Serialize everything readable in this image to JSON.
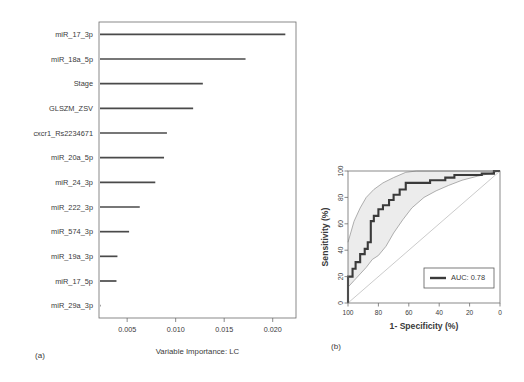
{
  "figure": {
    "panel_a_tag": "(a)",
    "panel_b_tag": "(b)"
  },
  "chart_data": [
    {
      "type": "bar",
      "orientation": "horizontal",
      "title": "",
      "xlabel": "Variable Importance: LC",
      "ylabel": "",
      "xlim": [
        0.0021,
        0.0224
      ],
      "xticks": [
        0.005,
        0.01,
        0.015,
        0.02
      ],
      "xtick_labels": [
        "0.005",
        "0.010",
        "0.015",
        "0.020"
      ],
      "grid": false,
      "legend": "none",
      "categories": [
        "miR_17_3p",
        "miR_18a_5p",
        "Stage",
        "GLSZM_ZSV",
        "cxcr1_Rs2234671",
        "miR_20a_5p",
        "miR_24_3p",
        "miR_222_3p",
        "miR_574_3p",
        "miR_19a_3p",
        "miR_17_5p",
        "miR_29a_3p"
      ],
      "values": [
        0.0213,
        0.0172,
        0.0128,
        0.0118,
        0.0091,
        0.0088,
        0.0079,
        0.0063,
        0.0052,
        0.004,
        0.0039,
        0.0022
      ]
    },
    {
      "type": "line",
      "subtype": "roc",
      "title": "",
      "xlabel": "1- Specificity (%)",
      "ylabel": "Sensitivity (%)",
      "xlim": [
        100,
        0
      ],
      "ylim": [
        0,
        100
      ],
      "x_reversed": true,
      "xticks": [
        100,
        80,
        60,
        40,
        20,
        0
      ],
      "xtick_labels": [
        "100",
        "80",
        "60",
        "40",
        "20",
        "0"
      ],
      "yticks": [
        0,
        20,
        40,
        60,
        80,
        100
      ],
      "ytick_labels": [
        "0",
        "20",
        "40",
        "60",
        "80",
        "100"
      ],
      "grid": false,
      "legend": "bottom-right",
      "legend_entries": [
        "AUC: 0.78"
      ],
      "auc_label": "AUC: 0.78",
      "auc_value": 0.78,
      "series": [
        {
          "name": "ROC curve",
          "points": [
            [
              100,
              0
            ],
            [
              100,
              20
            ],
            [
              97,
              20
            ],
            [
              97,
              26
            ],
            [
              95,
              26
            ],
            [
              95,
              31
            ],
            [
              92,
              31
            ],
            [
              92,
              37
            ],
            [
              89,
              37
            ],
            [
              89,
              41
            ],
            [
              87,
              41
            ],
            [
              87,
              46
            ],
            [
              85,
              46
            ],
            [
              85,
              62
            ],
            [
              83,
              62
            ],
            [
              83,
              66
            ],
            [
              80,
              66
            ],
            [
              80,
              71
            ],
            [
              77,
              71
            ],
            [
              77,
              74
            ],
            [
              73,
              74
            ],
            [
              73,
              78
            ],
            [
              70,
              78
            ],
            [
              70,
              82
            ],
            [
              66,
              82
            ],
            [
              66,
              86
            ],
            [
              62,
              86
            ],
            [
              62,
              91
            ],
            [
              46,
              91
            ],
            [
              46,
              93
            ],
            [
              36,
              93
            ],
            [
              36,
              95
            ],
            [
              30,
              95
            ],
            [
              30,
              97
            ],
            [
              12,
              97
            ],
            [
              12,
              98
            ],
            [
              4,
              98
            ],
            [
              4,
              100
            ],
            [
              0,
              100
            ]
          ]
        },
        {
          "name": "Upper 95% CI",
          "points": [
            [
              100,
              46
            ],
            [
              96,
              62
            ],
            [
              92,
              72
            ],
            [
              88,
              80
            ],
            [
              83,
              86
            ],
            [
              77,
              91
            ],
            [
              70,
              95
            ],
            [
              62,
              99
            ],
            [
              55,
              100
            ],
            [
              0,
              100
            ]
          ]
        },
        {
          "name": "Lower 95% CI",
          "points": [
            [
              100,
              0
            ],
            [
              100,
              12
            ],
            [
              96,
              17
            ],
            [
              92,
              22
            ],
            [
              88,
              27
            ],
            [
              84,
              33
            ],
            [
              80,
              36
            ],
            [
              75,
              43
            ],
            [
              70,
              53
            ],
            [
              64,
              63
            ],
            [
              58,
              72
            ],
            [
              50,
              80
            ],
            [
              42,
              85
            ],
            [
              34,
              89
            ],
            [
              25,
              93
            ],
            [
              15,
              96
            ],
            [
              7,
              98
            ],
            [
              0,
              100
            ]
          ]
        },
        {
          "name": "Chance diagonal",
          "points": [
            [
              100,
              0
            ],
            [
              0,
              100
            ]
          ]
        }
      ]
    }
  ]
}
